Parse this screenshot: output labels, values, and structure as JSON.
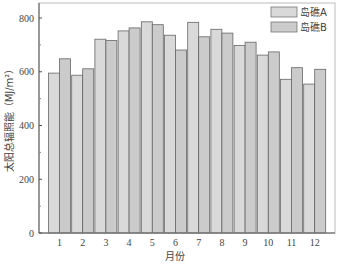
{
  "chart_data": {
    "type": "bar",
    "title": "",
    "xlabel": "月份",
    "ylabel": "太阳总辐照能（MJ/m²）",
    "categories": [
      "1",
      "2",
      "3",
      "4",
      "5",
      "6",
      "7",
      "8",
      "9",
      "10",
      "11",
      "12"
    ],
    "series": [
      {
        "name": "岛礁A",
        "color": "#d9d9d9",
        "values": [
          595,
          587,
          721,
          752,
          786,
          736,
          784,
          758,
          698,
          662,
          572,
          554
        ]
      },
      {
        "name": "岛礁B",
        "color": "#c8c8c8",
        "values": [
          648,
          611,
          716,
          763,
          775,
          681,
          730,
          744,
          710,
          674,
          615,
          609
        ]
      }
    ],
    "ylim": [
      0,
      850
    ],
    "yticks": [
      0,
      200,
      400,
      600,
      800
    ],
    "grid": false,
    "legend_position": "upper right"
  },
  "legend": {
    "items": [
      "岛礁A",
      "岛礁B"
    ]
  },
  "colors": {
    "bar_fill_a": "#d9d9d9",
    "bar_fill_b": "#cbcbcb",
    "bar_stroke": "#666666",
    "axis": "#555555"
  }
}
